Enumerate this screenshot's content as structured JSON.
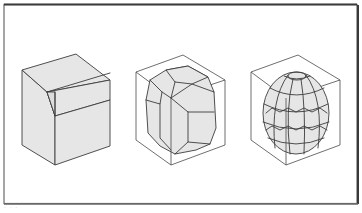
{
  "figure": {
    "panels": [
      {
        "id": "cube-with-slab",
        "label": "Cube with cut slab"
      },
      {
        "id": "faceted-polyhedron",
        "label": "Polyhedron inscribed in cube"
      },
      {
        "id": "spherical-polyhedron",
        "label": "Near-spherical polyhedron inscribed in cube"
      }
    ],
    "colors": {
      "background": "#ffffff",
      "frame": "#6a6a6a",
      "face_fill": "#e6e6e6",
      "line": "#3c3c3c"
    }
  },
  "caption": {
    "text": "· · ·"
  }
}
